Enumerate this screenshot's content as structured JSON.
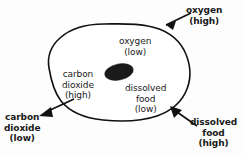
{
  "diagram": {
    "background_color": "#fdfdfd",
    "ink_color": "#111111",
    "cell": {
      "name": "cell",
      "fill_color": "#ffffff",
      "outline_color": "#111111"
    },
    "nucleus": {
      "name": "nucleus",
      "fill_color": "#1a1a1a"
    },
    "labels": {
      "oxygen_high": {
        "line1": "oxygen",
        "line2": "(high)"
      },
      "oxygen_low": {
        "line1": "oxygen",
        "line2": "(low)"
      },
      "carbon_dioxide_high": {
        "line1": "carbon",
        "line2": "dioxide",
        "line3": "(high)"
      },
      "carbon_dioxide_low": {
        "line1": "carbon",
        "line2": "dioxide",
        "line3": "(low)"
      },
      "dissolved_food_low": {
        "line1": "dissolved",
        "line2": "food",
        "line3": "(low)"
      },
      "dissolved_food_high": {
        "line1": "dissolved",
        "line2": "food",
        "line3": "(high)"
      }
    },
    "arrows": [
      {
        "name": "oxygen-inward-arrow",
        "direction": "into-cell",
        "substance": "oxygen"
      },
      {
        "name": "carbon-dioxide-outward-arrow",
        "direction": "out-of-cell",
        "substance": "carbon dioxide"
      },
      {
        "name": "dissolved-food-inward-arrow",
        "direction": "into-cell",
        "substance": "dissolved food"
      }
    ]
  }
}
